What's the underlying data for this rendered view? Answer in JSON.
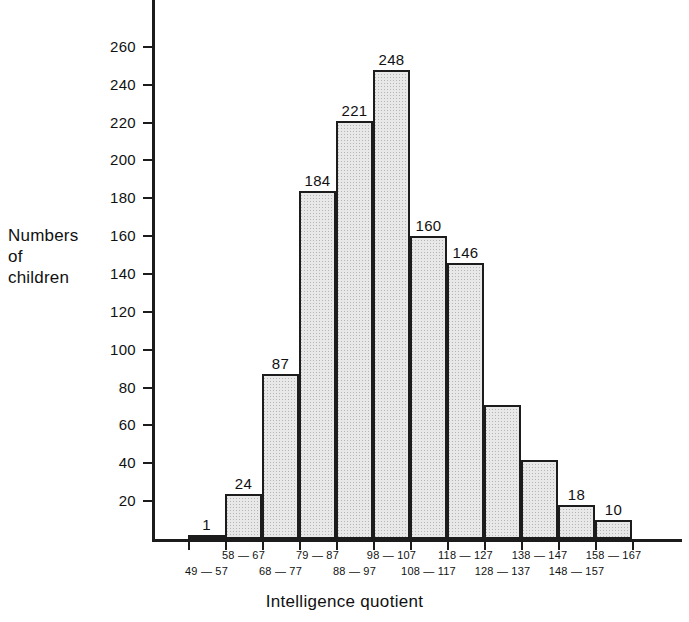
{
  "chart_data": {
    "type": "bar",
    "title": "",
    "subtitle": "",
    "xlabel": "Intelligence quotient",
    "ylabel": "Numbers of children",
    "ylabel_lines": [
      "Numbers",
      "of",
      "children"
    ],
    "categories": [
      "49 — 57",
      "58 — 67",
      "68 — 77",
      "79 — 87",
      "88 — 97",
      "98 — 107",
      "108 — 117",
      "118 — 127",
      "128 — 137",
      "138 — 147",
      "148 — 157",
      "158 — 167"
    ],
    "values": [
      1,
      24,
      87,
      184,
      221,
      248,
      160,
      146,
      71,
      42,
      18,
      10
    ],
    "value_labels": [
      "1",
      "24",
      "87",
      "184",
      "221",
      "248",
      "160",
      "146",
      "",
      "",
      "18",
      "10"
    ],
    "ylim": [
      0,
      285
    ],
    "yticks": [
      20,
      40,
      60,
      80,
      100,
      120,
      140,
      160,
      180,
      200,
      220,
      240,
      260
    ],
    "ytick_labels": [
      "20",
      "40",
      "60",
      "80",
      "100",
      "120",
      "140",
      "160",
      "180",
      "200",
      "220",
      "240",
      "260"
    ],
    "grid": false,
    "legend": false,
    "bar_fill_color": "#e8e8e8",
    "bar_edge_color": "#1c1c1c",
    "axis_color": "#1c1c1c",
    "bin_label_row": [
      "bottom",
      "top",
      "bottom",
      "top",
      "bottom",
      "top",
      "bottom",
      "top",
      "bottom",
      "top",
      "bottom",
      "top"
    ]
  }
}
